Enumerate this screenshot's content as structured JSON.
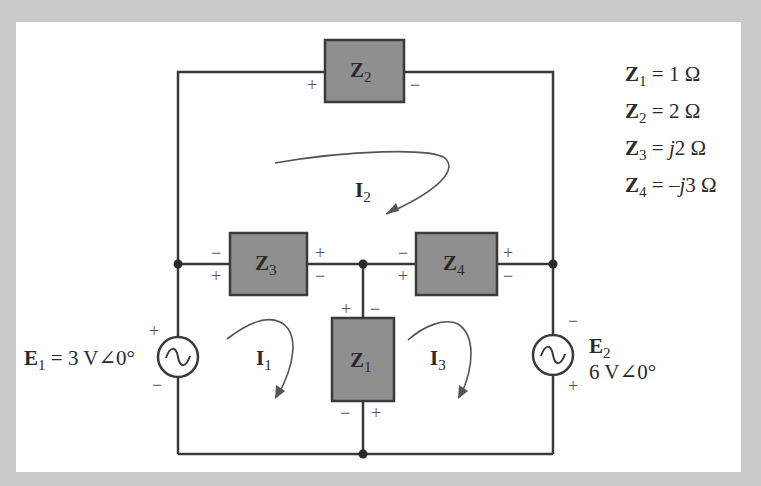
{
  "colors": {
    "frame": "#c9c9c9",
    "panel": "#ffffff",
    "wire": "#3a3a3a",
    "impedance_fill": "#8f8f8f",
    "arrow": "#555555"
  },
  "impedances": {
    "z1": {
      "symbol": "Z",
      "sub": "1"
    },
    "z2": {
      "symbol": "Z",
      "sub": "2"
    },
    "z3": {
      "symbol": "Z",
      "sub": "3"
    },
    "z4": {
      "symbol": "Z",
      "sub": "4"
    }
  },
  "values_legend": [
    {
      "symbol": "Z",
      "sub": "1",
      "rhs": "= 1 Ω"
    },
    {
      "symbol": "Z",
      "sub": "2",
      "rhs": "= 2 Ω"
    },
    {
      "symbol": "Z",
      "sub": "3",
      "rhs_prefix": "= ",
      "rhs_j": "j",
      "rhs_rest": "2 Ω"
    },
    {
      "symbol": "Z",
      "sub": "4",
      "rhs_prefix": "= –",
      "rhs_j": "j",
      "rhs_rest": "3 Ω"
    }
  ],
  "sources": {
    "e1": {
      "symbol": "E",
      "sub": "1",
      "value": "= 3 V∠0°"
    },
    "e2": {
      "symbol": "E",
      "sub": "2",
      "value": "6 V∠0°"
    }
  },
  "mesh_currents": [
    {
      "symbol": "I",
      "sub": "1"
    },
    {
      "symbol": "I",
      "sub": "2"
    },
    {
      "symbol": "I",
      "sub": "3"
    }
  ],
  "signs": {
    "plus": "+",
    "minus": "−"
  }
}
